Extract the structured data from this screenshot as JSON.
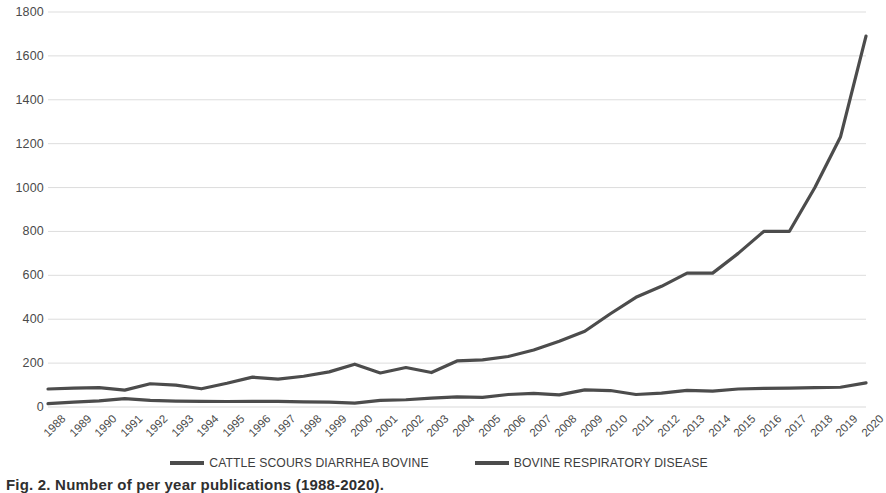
{
  "chart_data": {
    "type": "line",
    "title": "",
    "xlabel": "",
    "ylabel": "",
    "ylim": [
      0,
      1800
    ],
    "ytick_step": 200,
    "grid": true,
    "legend_position": "bottom",
    "line_color": "#4c4c4c",
    "gridline_color": "#d9d9d9",
    "categories": [
      "1988",
      "1989",
      "1990",
      "1991",
      "1992",
      "1993",
      "1994",
      "1995",
      "1996",
      "1997",
      "1998",
      "1999",
      "2000",
      "2001",
      "2002",
      "2003",
      "2004",
      "2005",
      "2006",
      "2007",
      "2008",
      "2009",
      "2010",
      "2011",
      "2012",
      "2013",
      "2014",
      "2015",
      "2016",
      "2017",
      "2018",
      "2019",
      "2020"
    ],
    "yticks": [
      "0",
      "200",
      "400",
      "600",
      "800",
      "1000",
      "1200",
      "1400",
      "1600",
      "1800"
    ],
    "series": [
      {
        "name": "CATTLE SCOURS DIARRHEA BOVINE",
        "values": [
          15,
          22,
          28,
          38,
          30,
          27,
          26,
          25,
          26,
          26,
          23,
          22,
          18,
          30,
          33,
          40,
          46,
          44,
          57,
          62,
          55,
          78,
          75,
          57,
          63,
          76,
          72,
          82,
          85,
          86,
          88,
          90,
          110
        ]
      },
      {
        "name": "BOVINE RESPIRATORY DISEASE",
        "values": [
          82,
          86,
          88,
          77,
          106,
          100,
          83,
          108,
          136,
          127,
          140,
          160,
          195,
          155,
          180,
          157,
          210,
          215,
          230,
          260,
          300,
          345,
          425,
          500,
          550,
          610,
          610,
          700,
          800,
          800,
          1000,
          1230,
          1690
        ]
      }
    ]
  },
  "legend": {
    "items": [
      {
        "label": "CATTLE SCOURS DIARRHEA BOVINE",
        "color": "#4c4c4c"
      },
      {
        "label": "BOVINE RESPIRATORY DISEASE",
        "color": "#4c4c4c"
      }
    ]
  },
  "caption": {
    "text": "Fig. 2. Number of per year publications (1988-2020)."
  }
}
